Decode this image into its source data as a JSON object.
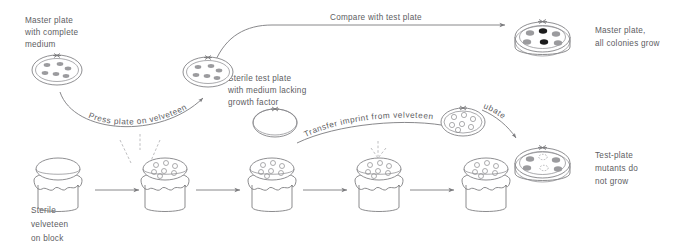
{
  "figure": {
    "background_color": "#ffffff",
    "line_color": "#7b7b7e",
    "text_color": "#5d5d5f",
    "colony_gray": "#9b9b9e",
    "colony_dark": "#1c1c1c"
  },
  "labels": {
    "master_plate_complete": "Master plate\nwith complete\nmedium",
    "master_plate_complete_lines": [
      "Master plate",
      "with complete",
      "medium"
    ],
    "sterile_test_plate_lines": [
      "Sterile test plate",
      "with medium lacking",
      "growth factor"
    ],
    "sterile_velveteen_lines": [
      "Sterile",
      "velveteen",
      "on block"
    ],
    "master_plate_result_lines": [
      "Master plate,",
      "all colonies grow"
    ],
    "test_plate_result_lines": [
      "Test-plate",
      "mutants do",
      "not grow"
    ],
    "press_plate": "Press plate on velveteen",
    "compare_with_test_plate": "Compare with test plate",
    "transfer_imprint": "Transfer imprint from velveteen",
    "incubate": "Incubate"
  },
  "plates": {
    "master_plate_top": {
      "name": "master-plate-with-complete-medium",
      "colony_count": 6,
      "colony_style": "small-gray-ovals"
    },
    "master_plate_replica": {
      "name": "master-plate-after-pressing",
      "colony_count": 6,
      "colony_style": "small-gray-ovals"
    },
    "sterile_test_plate": {
      "name": "sterile-test-plate-empty",
      "colony_count": 0,
      "colony_style": "none"
    },
    "imprinted_test_plate": {
      "name": "test-plate-with-imprint",
      "colony_count": 7,
      "colony_style": "outline-circles"
    },
    "master_plate_petri": {
      "name": "master-plate-petri-dish-result",
      "colony_count": 6,
      "dark_colonies": 2,
      "gray_colonies": 4
    },
    "test_plate_petri": {
      "name": "test-plate-petri-dish-result",
      "colony_count": 6,
      "grown_colonies": 4,
      "missing_colonies": 2
    }
  },
  "blocks": [
    {
      "name": "velveteen-block-sterile",
      "has_imprint": false
    },
    {
      "name": "velveteen-block-imprinted-1",
      "has_imprint": true
    },
    {
      "name": "velveteen-block-imprinted-2",
      "has_imprint": true
    },
    {
      "name": "velveteen-block-imprinted-3",
      "has_imprint": true
    },
    {
      "name": "velveteen-block-imprinted-4",
      "has_imprint": true
    }
  ],
  "arrows": {
    "count": 4,
    "direction": "left-to-right"
  }
}
